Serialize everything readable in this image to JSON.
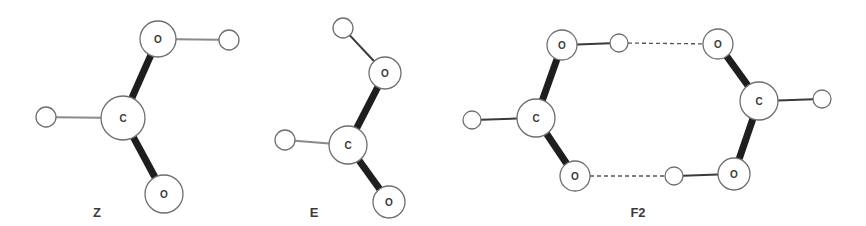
{
  "figure": {
    "colors": {
      "background": "#ffffff",
      "atom_outline": "#6e6e6e",
      "covalent_bond_heavy": "#1e1e1e",
      "covalent_bond_light": "#8a8a8a",
      "hydrogen_bond_dashed": "#555555",
      "text": "#3a3a3a"
    }
  },
  "molecules": [
    {
      "id": "Z",
      "label": "Z",
      "label_pos": [
        97,
        212
      ],
      "atoms": [
        {
          "element": "O",
          "label": "O",
          "x": 158,
          "y": 39,
          "r": 18
        },
        {
          "element": "H",
          "label": "",
          "x": 229,
          "y": 40,
          "r": 10
        },
        {
          "element": "C",
          "label": "C",
          "x": 123,
          "y": 118,
          "r": 22
        },
        {
          "element": "H",
          "label": "",
          "x": 46,
          "y": 117,
          "r": 10
        },
        {
          "element": "O",
          "label": "O",
          "x": 164,
          "y": 194,
          "r": 19
        }
      ],
      "bonds": [
        {
          "from": 0,
          "to": 1,
          "type": "thin"
        },
        {
          "from": 2,
          "to": 0,
          "type": "thick"
        },
        {
          "from": 2,
          "to": 3,
          "type": "thin"
        },
        {
          "from": 2,
          "to": 4,
          "type": "thick"
        }
      ]
    },
    {
      "id": "E",
      "label": "E",
      "label_pos": [
        314,
        212
      ],
      "atoms": [
        {
          "element": "H",
          "label": "",
          "x": 343,
          "y": 28,
          "r": 10
        },
        {
          "element": "O",
          "label": "O",
          "x": 385,
          "y": 73,
          "r": 16
        },
        {
          "element": "C",
          "label": "C",
          "x": 348,
          "y": 145,
          "r": 19
        },
        {
          "element": "H",
          "label": "",
          "x": 285,
          "y": 140,
          "r": 10
        },
        {
          "element": "O",
          "label": "O",
          "x": 389,
          "y": 202,
          "r": 16
        }
      ],
      "bonds": [
        {
          "from": 0,
          "to": 1,
          "type": "thin-dark"
        },
        {
          "from": 2,
          "to": 1,
          "type": "thick"
        },
        {
          "from": 2,
          "to": 3,
          "type": "thin"
        },
        {
          "from": 2,
          "to": 4,
          "type": "thick"
        }
      ]
    },
    {
      "id": "F2",
      "label": "F2",
      "label_pos": [
        638,
        212
      ],
      "atoms": [
        {
          "element": "O",
          "label": "O",
          "x": 562,
          "y": 45,
          "r": 15
        },
        {
          "element": "H",
          "label": "",
          "x": 619,
          "y": 43,
          "r": 9
        },
        {
          "element": "C",
          "label": "C",
          "x": 536,
          "y": 118,
          "r": 19
        },
        {
          "element": "H",
          "label": "",
          "x": 472,
          "y": 120,
          "r": 9
        },
        {
          "element": "O",
          "label": "O",
          "x": 575,
          "y": 176,
          "r": 15
        },
        {
          "element": "O",
          "label": "O",
          "x": 718,
          "y": 44,
          "r": 15
        },
        {
          "element": "C",
          "label": "C",
          "x": 759,
          "y": 101,
          "r": 19
        },
        {
          "element": "H",
          "label": "",
          "x": 822,
          "y": 99,
          "r": 9
        },
        {
          "element": "O",
          "label": "O",
          "x": 734,
          "y": 174,
          "r": 16
        },
        {
          "element": "H",
          "label": "",
          "x": 674,
          "y": 176,
          "r": 9
        }
      ],
      "bonds": [
        {
          "from": 0,
          "to": 1,
          "type": "thin-dark"
        },
        {
          "from": 2,
          "to": 0,
          "type": "thick"
        },
        {
          "from": 2,
          "to": 3,
          "type": "thin-dark"
        },
        {
          "from": 2,
          "to": 4,
          "type": "thick"
        },
        {
          "from": 6,
          "to": 5,
          "type": "thick"
        },
        {
          "from": 6,
          "to": 7,
          "type": "thin-dark"
        },
        {
          "from": 6,
          "to": 8,
          "type": "thick"
        },
        {
          "from": 8,
          "to": 9,
          "type": "thin-dark"
        },
        {
          "from": 1,
          "to": 5,
          "type": "hbond"
        },
        {
          "from": 4,
          "to": 9,
          "type": "hbond"
        }
      ]
    }
  ]
}
